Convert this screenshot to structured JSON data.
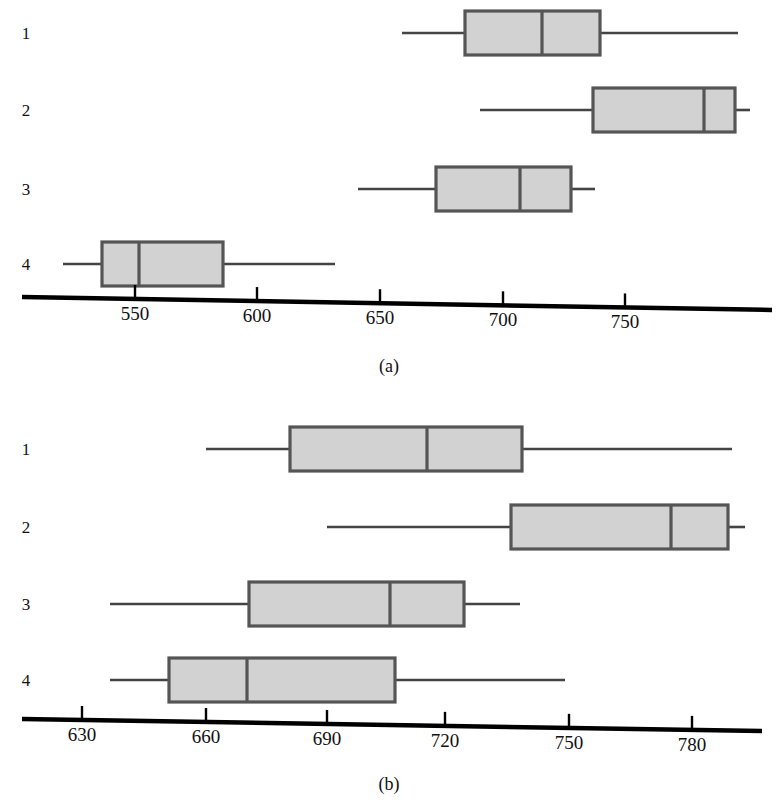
{
  "figure": {
    "title": "",
    "background": "#ffffff",
    "box_fill": "#d2d2d2",
    "box_stroke": "#555555",
    "line_color": "#444444",
    "axis_color": "#000000"
  },
  "panels": [
    {
      "id": "a",
      "caption": "(a)",
      "axis": {
        "ticks": [
          550,
          600,
          650,
          700,
          750
        ],
        "tick_labels": [
          "550",
          "600",
          "650",
          "700",
          "750"
        ],
        "xlim": [
          520,
          795
        ],
        "px_per_unit": 2.44,
        "x_at_550_px": 135
      },
      "row_labels": [
        "1",
        "2",
        "3",
        "4"
      ]
    },
    {
      "id": "b",
      "caption": "(b)",
      "axis": {
        "ticks": [
          630,
          660,
          690,
          720,
          750,
          780
        ],
        "tick_labels": [
          "630",
          "660",
          "690",
          "720",
          "750",
          "780"
        ],
        "xlim": [
          615,
          800
        ],
        "px_per_unit": 4.1,
        "x_at_630_px": 82
      },
      "row_labels": [
        "1",
        "2",
        "3",
        "4"
      ]
    }
  ],
  "chart_data": [
    {
      "type": "box",
      "orientation": "horizontal",
      "title": "(a)",
      "xlabel": "",
      "ylabel": "",
      "xlim": [
        520,
        795
      ],
      "grid": false,
      "legend": null,
      "categories": [
        "1",
        "2",
        "3",
        "4"
      ],
      "boxes": [
        {
          "label": "1",
          "whisker_low": 630,
          "q1": 656,
          "median": 687,
          "q3": 711,
          "whisker_high": 767
        },
        {
          "label": "2",
          "whisker_low": 662,
          "q1": 708,
          "median": 753,
          "q3": 766,
          "whisker_high": 772
        },
        {
          "label": "3",
          "whisker_low": 641,
          "q1": 673,
          "median": 707,
          "q3": 728,
          "whisker_high": 738
        },
        {
          "label": "4",
          "whisker_low": 520,
          "q1": 536,
          "median": 551,
          "q3": 586,
          "whisker_high": 632
        }
      ]
    },
    {
      "type": "box",
      "orientation": "horizontal",
      "title": "(b)",
      "xlabel": "",
      "ylabel": "",
      "xlim": [
        615,
        800
      ],
      "grid": false,
      "legend": null,
      "categories": [
        "1",
        "2",
        "3",
        "4"
      ],
      "boxes": [
        {
          "label": "1",
          "whisker_low": 660,
          "q1": 681,
          "median": 714,
          "q3": 737,
          "whisker_high": 788
        },
        {
          "label": "2",
          "whisker_low": 690,
          "q1": 735,
          "median": 774,
          "q3": 788,
          "whisker_high": 792
        },
        {
          "label": "3",
          "whisker_low": 637,
          "q1": 671,
          "median": 705,
          "q3": 723,
          "whisker_high": 737
        },
        {
          "label": "4",
          "whisker_low": 637,
          "q1": 651,
          "median": 670,
          "q3": 707,
          "whisker_high": 748
        }
      ]
    }
  ],
  "panel_a_geometry": {
    "rows": [
      {
        "y": 33,
        "label_y": 25,
        "whisker_low_px": 402,
        "q1_px": 465,
        "median_px": 542,
        "q3_px": 600,
        "whisker_high_px": 738
      },
      {
        "y": 110,
        "label_y": 102,
        "whisker_low_px": 480,
        "q1_px": 593,
        "median_px": 704,
        "q3_px": 735,
        "whisker_high_px": 750
      },
      {
        "y": 189,
        "label_y": 181,
        "whisker_low_px": 358,
        "q1_px": 436,
        "median_px": 520,
        "q3_px": 571,
        "whisker_high_px": 595
      },
      {
        "y": 264,
        "label_y": 256,
        "whisker_low_px": 63,
        "q1_px": 102,
        "median_px": 139,
        "q3_px": 223,
        "whisker_high_px": 335
      }
    ],
    "axis": {
      "x_start": 22,
      "y_start": 297,
      "x_end": 772,
      "y_end": 310,
      "ticks_px": [
        135,
        257,
        380,
        503,
        625
      ],
      "tick_label_y": 313
    },
    "label_x": 14,
    "caption_x": 349,
    "caption_y": 357
  },
  "panel_b_geometry": {
    "rows": [
      {
        "y": 449,
        "label_y": 441,
        "whisker_low_px": 206,
        "q1_px": 290,
        "median_px": 427,
        "q3_px": 522,
        "whisker_high_px": 732
      },
      {
        "y": 527,
        "label_y": 519,
        "whisker_low_px": 327,
        "q1_px": 511,
        "median_px": 671,
        "q3_px": 728,
        "whisker_high_px": 745
      },
      {
        "y": 604,
        "label_y": 596,
        "whisker_low_px": 110,
        "q1_px": 249,
        "median_px": 390,
        "q3_px": 464,
        "whisker_high_px": 520
      },
      {
        "y": 680,
        "label_y": 672,
        "whisker_low_px": 110,
        "q1_px": 169,
        "median_px": 247,
        "q3_px": 395,
        "whisker_high_px": 565
      }
    ],
    "axis": {
      "x_start": 22,
      "y_start": 719,
      "x_end": 762,
      "y_end": 731,
      "ticks_px": [
        82,
        206,
        327,
        445,
        569,
        692
      ],
      "tick_label_y": 733
    },
    "label_x": 14,
    "caption_x": 349,
    "caption_y": 775
  }
}
